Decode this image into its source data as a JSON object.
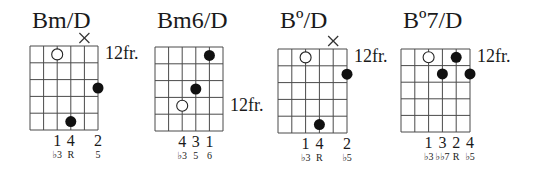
{
  "chords": [
    {
      "name": "Bm/D",
      "fret_label": "12fr.",
      "fret_label_row": 1,
      "grid": {
        "left": 30,
        "top": 46,
        "width": 68,
        "height": 84
      },
      "muted_strings": [
        5
      ],
      "dots": [
        {
          "string": 3,
          "fret": 1,
          "type": "open"
        },
        {
          "string": 6,
          "fret": 3,
          "type": "filled"
        },
        {
          "string": 4,
          "fret": 5,
          "type": "filled"
        }
      ],
      "fingers": [
        {
          "string": 3,
          "label": "1"
        },
        {
          "string": 4,
          "label": "4"
        },
        {
          "string": 6,
          "label": "2"
        }
      ],
      "degrees": [
        {
          "string": 3,
          "label": "♭3"
        },
        {
          "string": 4,
          "label": "R"
        },
        {
          "string": 6,
          "label": "5"
        }
      ]
    },
    {
      "name": "Bm6/D",
      "fret_label": "12fr.",
      "fret_label_row": 4,
      "grid": {
        "left": 155,
        "top": 47,
        "width": 68,
        "height": 84
      },
      "muted_strings": [],
      "dots": [
        {
          "string": 5,
          "fret": 1,
          "type": "filled"
        },
        {
          "string": 4,
          "fret": 3,
          "type": "filled"
        },
        {
          "string": 3,
          "fret": 4,
          "type": "open"
        }
      ],
      "fingers": [
        {
          "string": 3,
          "label": "4"
        },
        {
          "string": 4,
          "label": "3"
        },
        {
          "string": 5,
          "label": "1"
        }
      ],
      "degrees": [
        {
          "string": 3,
          "label": "♭3"
        },
        {
          "string": 4,
          "label": "5"
        },
        {
          "string": 5,
          "label": "6"
        }
      ]
    },
    {
      "name": "Bº/D",
      "fret_label": "12fr.",
      "fret_label_row": 1,
      "grid": {
        "left": 278,
        "top": 49,
        "width": 69,
        "height": 84
      },
      "muted_strings": [
        5
      ],
      "dots": [
        {
          "string": 3,
          "fret": 1,
          "type": "open"
        },
        {
          "string": 6,
          "fret": 2,
          "type": "filled"
        },
        {
          "string": 4,
          "fret": 5,
          "type": "filled"
        }
      ],
      "fingers": [
        {
          "string": 3,
          "label": "1"
        },
        {
          "string": 4,
          "label": "4"
        },
        {
          "string": 6,
          "label": "2"
        }
      ],
      "degrees": [
        {
          "string": 3,
          "label": "♭3"
        },
        {
          "string": 4,
          "label": "R"
        },
        {
          "string": 6,
          "label": "♭5"
        }
      ]
    },
    {
      "name": "Bº7/D",
      "fret_label": "12fr.",
      "fret_label_row": 1,
      "grid": {
        "left": 401,
        "top": 49,
        "width": 69,
        "height": 83
      },
      "muted_strings": [],
      "dots": [
        {
          "string": 3,
          "fret": 1,
          "type": "open"
        },
        {
          "string": 5,
          "fret": 1,
          "type": "filled"
        },
        {
          "string": 4,
          "fret": 2,
          "type": "filled"
        },
        {
          "string": 6,
          "fret": 2,
          "type": "filled"
        }
      ],
      "fingers": [
        {
          "string": 3,
          "label": "1"
        },
        {
          "string": 4,
          "label": "3"
        },
        {
          "string": 5,
          "label": "2"
        },
        {
          "string": 6,
          "label": "4"
        }
      ],
      "degrees": [
        {
          "string": 3,
          "label": "♭3"
        },
        {
          "string": 4,
          "label": "♭♭7"
        },
        {
          "string": 5,
          "label": "R"
        },
        {
          "string": 6,
          "label": "♭5"
        }
      ]
    }
  ],
  "layout": {
    "strings": 6,
    "frets": 5,
    "line_color": "#4a4a4a",
    "dot_color": "#111111"
  }
}
